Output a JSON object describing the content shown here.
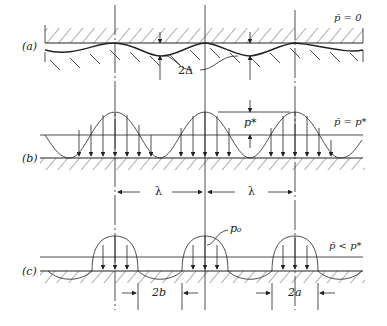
{
  "panels": {
    "a": {
      "label": "(a)",
      "condition": "p̄ = 0",
      "dimension": "2Δ"
    },
    "b": {
      "label": "(b)",
      "condition": "p̄ = p*",
      "peak_label": "p*",
      "wavelength_left": "λ",
      "wavelength_right": "λ"
    },
    "c": {
      "label": "(c)",
      "condition": "p̄ < p*",
      "pressure_label": "p₀",
      "contact_width": "2a",
      "gap_width": "2b"
    }
  },
  "colors": {
    "line": "#222222",
    "background": "#ffffff"
  }
}
